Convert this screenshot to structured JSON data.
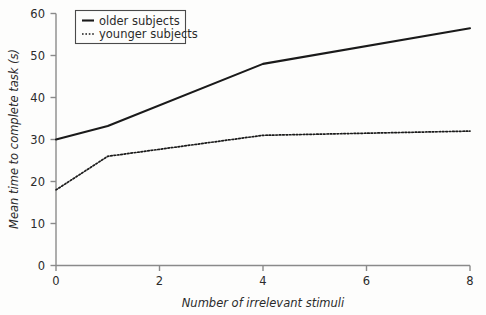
{
  "chart_data": {
    "type": "line",
    "title": "",
    "xlabel": "Number of irrelevant stimuli",
    "ylabel": "Mean time to complete task (s)",
    "xlim": [
      0,
      8
    ],
    "ylim": [
      0,
      60
    ],
    "xticks": [
      "0",
      "2",
      "4",
      "6",
      "8"
    ],
    "xtick_values": [
      0,
      2,
      4,
      6,
      8
    ],
    "yticks": [
      "0",
      "10",
      "20",
      "30",
      "40",
      "50",
      "60"
    ],
    "ytick_values": [
      0,
      10,
      20,
      30,
      40,
      50,
      60
    ],
    "grid": false,
    "legend_position": "top-left-inside",
    "x": [
      0,
      1,
      4,
      8
    ],
    "series": [
      {
        "name": "older subjects",
        "style": "solid",
        "color": "#1a1a1a",
        "values": [
          30,
          33.2,
          48,
          56.5
        ]
      },
      {
        "name": "younger subjects",
        "style": "dotted",
        "color": "#1a1a1a",
        "values": [
          18,
          26,
          31,
          32
        ]
      }
    ]
  },
  "legend": {
    "entries": [
      {
        "label": "older subjects"
      },
      {
        "label": "younger subjects"
      }
    ]
  },
  "colors": {
    "background": "#fdfdfc",
    "axis": "#8a8a8a",
    "ink": "#1a1a1a",
    "text": "#2b2b2b"
  }
}
